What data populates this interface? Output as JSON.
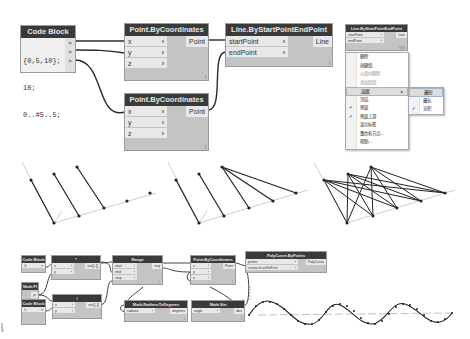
{
  "top_graph": {
    "code_block": {
      "title": "Code Block",
      "lines": [
        "{0,5,10};",
        "10;",
        "0..#5..5;"
      ],
      "outputs": [
        ">",
        ">",
        ">"
      ]
    },
    "point_node_1": {
      "title": "Point.ByCoordinates",
      "inputs": [
        "x",
        "y",
        "z"
      ],
      "output": "Point",
      "lacing_marker": "l"
    },
    "point_node_2": {
      "title": "Point.ByCoordinates",
      "inputs": [
        "x",
        "y",
        "z"
      ],
      "output": "Point",
      "lacing_marker": "l"
    },
    "line_node": {
      "title": "Line.ByStartPointEndPoint",
      "inputs": [
        "startPoint",
        "endPoint"
      ],
      "output": "Line",
      "lacing_marker": "l"
    },
    "line_node_small": {
      "title": "Line.ByStartPointEndPoint",
      "inputs": [
        "startPoint",
        "endPoint"
      ],
      "output": "Line",
      "lacing_marker": "XXX"
    }
  },
  "context_menu": {
    "items": [
      {
        "label": "删除",
        "enabled": true
      },
      {
        "label": "创建组",
        "enabled": true
      },
      {
        "label": "从组中删除",
        "enabled": false
      },
      {
        "label": "添加到组",
        "enabled": false
      },
      {
        "label": "连缀",
        "enabled": true,
        "submenu": true,
        "highlighted": true
      },
      {
        "label": "冻结",
        "enabled": true
      },
      {
        "label": "预览",
        "enabled": true,
        "checked": true
      },
      {
        "label": "预览上游",
        "enabled": true,
        "checked": true
      },
      {
        "label": "显示标签",
        "enabled": true
      },
      {
        "label": "重命名节点...",
        "enabled": true
      },
      {
        "label": "帮助...",
        "enabled": true
      }
    ],
    "submenu_arrow": "▸",
    "check_glyph": "✔",
    "lacing_submenu": [
      {
        "label": "最短",
        "highlighted": true
      },
      {
        "label": "最长"
      },
      {
        "label": "叉积",
        "checked": true
      }
    ]
  },
  "previews": [
    {
      "name": "shortest-lacing",
      "caption": ""
    },
    {
      "name": "longest-lacing",
      "caption": ""
    },
    {
      "name": "cross-product-lacing",
      "caption": ""
    }
  ],
  "bottom_graph": {
    "code_block_1": {
      "title": "Code Block",
      "value": "4;",
      "output": ">"
    },
    "math_pi": {
      "title": "Math.PI",
      "output": "pi"
    },
    "code_block_2": {
      "title": "Code Block",
      "value": "1;",
      "output": ">"
    },
    "multiply_node": {
      "title": "*",
      "inputs": [
        "x",
        "y"
      ],
      "output": "var[]..[]"
    },
    "divide_node": {
      "title": "/",
      "inputs": [
        "x",
        "y"
      ],
      "output": "var[]..[]"
    },
    "range_node": {
      "title": "Range",
      "inputs": [
        "start",
        "end",
        "step"
      ],
      "output": "seq",
      "lacing_marker": "l"
    },
    "point_node": {
      "title": "Point.ByCoordinates",
      "inputs": [
        "x",
        "y",
        "z"
      ],
      "output": "Point",
      "lacing_marker": "l"
    },
    "radians_node": {
      "title": "Math.RadiansToDegrees",
      "inputs": [
        "radians"
      ],
      "output": "degrees",
      "lacing_marker": "l"
    },
    "sin_node": {
      "title": "Math.Sin",
      "inputs": [
        "angle"
      ],
      "output": "dou",
      "lacing_marker": "l"
    },
    "polycurve_node": {
      "title": "PolyCurve.ByPoints",
      "inputs": [
        "points",
        "connectLastToFirst"
      ],
      "output": "PolyCurve",
      "lacing_marker": "l"
    }
  },
  "colors": {
    "node_header": "#3a3a3a",
    "node_body": "#c4c4c4",
    "port_bg": "#e8e8e8",
    "wire": "#2a2a2a",
    "background": "#ffffff",
    "check": "#1a5fb4"
  }
}
